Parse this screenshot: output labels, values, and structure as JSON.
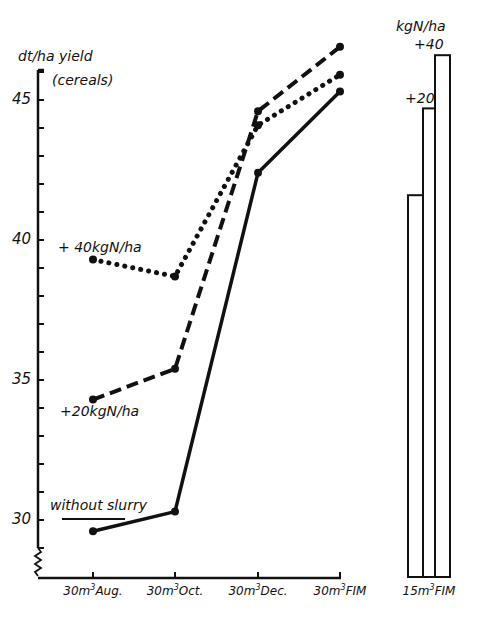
{
  "chart_data": {
    "type": "line",
    "title": "",
    "ylabel": "dt/ha yield (cereals)",
    "ylabel_line1": "dt/ha yield",
    "ylabel_line2": "(cereals)",
    "xlabel": "",
    "ylim": [
      28,
      47
    ],
    "yticks": [
      30,
      35,
      40,
      45
    ],
    "ytick_labels": [
      "30",
      "35",
      "40",
      "45"
    ],
    "grid": false,
    "categories": [
      "30m³Aug.",
      "30m³Oct.",
      "30m³Dec.",
      "30m³FIM"
    ],
    "category_labels": [
      {
        "num": "30m",
        "sup": "3",
        "rest": "Aug."
      },
      {
        "num": "30m",
        "sup": "3",
        "rest": "Oct."
      },
      {
        "num": "30m",
        "sup": "3",
        "rest": "Dec."
      },
      {
        "num": "30m",
        "sup": "3",
        "rest": "FIM"
      }
    ],
    "series": [
      {
        "name": "without slurry",
        "style": "solid",
        "values": [
          29.6,
          30.3,
          42.4,
          45.3
        ]
      },
      {
        "name": "+20kgN/ha",
        "style": "dashed",
        "values": [
          34.3,
          35.4,
          44.6,
          46.9
        ]
      },
      {
        "name": "+40kgN/ha",
        "style": "dotted",
        "values": [
          39.3,
          38.7,
          44.1,
          45.9
        ]
      }
    ],
    "annotations": {
      "without_slurry": "without slurry",
      "plus20": "+20kgN/ha",
      "plus40": "+ 40kgN/ha"
    },
    "bar_panel": {
      "type": "bar",
      "unit_label": "kgN/ha",
      "category": "15m³FIM",
      "category_label": {
        "num": "15m",
        "sup": "3",
        "rest": "FIM"
      },
      "bars": [
        {
          "name": "base",
          "label": "",
          "value": 41.6
        },
        {
          "name": "+20",
          "label": "+20",
          "value": 44.7
        },
        {
          "name": "+40",
          "label": "+40",
          "value": 46.6
        }
      ]
    }
  }
}
